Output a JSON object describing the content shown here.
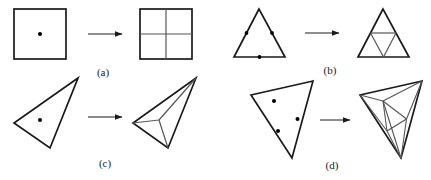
{
  "figure": {
    "title": "",
    "background_color": "#ffffff",
    "stroke_color": "#1a1a1a",
    "inner_stroke_color": "#555555",
    "point_color": "#000000",
    "width": 431,
    "height": 180
  },
  "panels": [
    {
      "id": "a",
      "caption": "(a)",
      "caption_x": 103,
      "caption_y": 76,
      "input_shape": "square",
      "input_points": 1,
      "output_shape": "square-quadrisected",
      "output_cells": 4,
      "arrow_label": "refines-to"
    },
    {
      "id": "b",
      "caption": "(b)",
      "caption_x": 330,
      "caption_y": 74,
      "input_shape": "triangle",
      "input_points": 3,
      "output_shape": "triangle-midpoint-subdivision",
      "output_cells": 4,
      "arrow_label": "refines-to"
    },
    {
      "id": "c",
      "caption": "(c)",
      "caption_x": 105,
      "caption_y": 167,
      "input_shape": "thin-triangle",
      "input_points": 1,
      "output_shape": "thin-triangle-fan-subdivision",
      "output_cells": 3,
      "arrow_label": "refines-to"
    },
    {
      "id": "d",
      "caption": "(d)",
      "caption_x": 332,
      "caption_y": 169,
      "input_shape": "triangle",
      "input_points": 3,
      "output_shape": "triangle-multi-subdivision",
      "output_cells": 9,
      "arrow_label": "refines-to"
    }
  ],
  "geometry": {
    "panel_a": {
      "square_in": {
        "x": 14,
        "y": 9,
        "w": 52,
        "h": 50
      },
      "dot_in": {
        "cx": 40,
        "cy": 34,
        "r": 2.0
      },
      "arrow": {
        "x1": 88,
        "y1": 34,
        "x2": 124,
        "y2": 34
      },
      "square_out": {
        "x": 140,
        "y": 9,
        "w": 52,
        "h": 50
      },
      "split_v": {
        "x1": 166,
        "y1": 9,
        "x2": 166,
        "y2": 59
      },
      "split_h": {
        "x1": 140,
        "y1": 34,
        "x2": 192,
        "y2": 34
      }
    },
    "panel_b": {
      "tri_in": [
        [
          259,
          9
        ],
        [
          234,
          57
        ],
        [
          285,
          57
        ]
      ],
      "dots_in": [
        {
          "cx": 246.5,
          "cy": 33,
          "r": 1.9
        },
        {
          "cx": 272,
          "cy": 33,
          "r": 1.9
        },
        {
          "cx": 259.5,
          "cy": 57,
          "r": 1.9
        }
      ],
      "arrow": {
        "x1": 305,
        "y1": 33,
        "x2": 341,
        "y2": 33
      },
      "tri_out": [
        [
          383,
          9
        ],
        [
          358,
          57
        ],
        [
          409,
          57
        ]
      ],
      "inner_edges": [
        [
          [
            370.5,
            33
          ],
          [
            396,
            33
          ]
        ],
        [
          [
            370.5,
            33
          ],
          [
            383.5,
            57
          ]
        ],
        [
          [
            396,
            33
          ],
          [
            383.5,
            57
          ]
        ]
      ]
    },
    "panel_c": {
      "tri_in": [
        [
          78,
          78
        ],
        [
          14,
          123
        ],
        [
          50,
          148
        ]
      ],
      "dot_in": {
        "cx": 40,
        "cy": 120,
        "r": 2.0
      },
      "arrow": {
        "x1": 88,
        "y1": 117,
        "x2": 124,
        "y2": 117
      },
      "tri_out": [
        [
          196,
          78
        ],
        [
          133,
          123
        ],
        [
          168,
          148
        ]
      ],
      "interior_point": {
        "cx": 159,
        "cy": 120
      },
      "fan_edges": [
        [
          [
            159,
            120
          ],
          [
            196,
            78
          ]
        ],
        [
          [
            159,
            120
          ],
          [
            133,
            123
          ]
        ],
        [
          [
            159,
            120
          ],
          [
            168,
            148
          ]
        ]
      ]
    },
    "panel_d": {
      "tri_in": [
        [
          313,
          81
        ],
        [
          251,
          95
        ],
        [
          292,
          158
        ]
      ],
      "dots_in": [
        {
          "cx": 274,
          "cy": 101,
          "r": 2.0
        },
        {
          "cx": 278,
          "cy": 131,
          "r": 2.0
        },
        {
          "cx": 297.5,
          "cy": 119,
          "r": 2.0
        }
      ],
      "arrow": {
        "x1": 320,
        "y1": 120,
        "x2": 352,
        "y2": 120
      },
      "tri_out": [
        [
          422,
          81
        ],
        [
          360,
          95
        ],
        [
          401,
          158
        ]
      ],
      "inner_points": [
        {
          "cx": 383,
          "cy": 101
        },
        {
          "cx": 387,
          "cy": 131
        },
        {
          "cx": 406.5,
          "cy": 119
        }
      ],
      "inner_edges": [
        [
          [
            383,
            101
          ],
          [
            387,
            131
          ]
        ],
        [
          [
            387,
            131
          ],
          [
            406.5,
            119
          ]
        ],
        [
          [
            406.5,
            119
          ],
          [
            383,
            101
          ]
        ],
        [
          [
            383,
            101
          ],
          [
            422,
            81
          ]
        ],
        [
          [
            383,
            101
          ],
          [
            360,
            95
          ]
        ],
        [
          [
            387,
            131
          ],
          [
            360,
            95
          ]
        ],
        [
          [
            387,
            131
          ],
          [
            401,
            158
          ]
        ],
        [
          [
            406.5,
            119
          ],
          [
            401,
            158
          ]
        ],
        [
          [
            406.5,
            119
          ],
          [
            422,
            81
          ]
        ],
        [
          [
            383,
            101
          ],
          [
            401,
            158
          ]
        ]
      ]
    }
  },
  "arrows": {
    "head_length": 7,
    "head_width": 4,
    "stroke_width": 1
  }
}
